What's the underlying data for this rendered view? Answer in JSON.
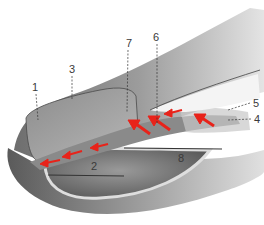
{
  "diagram": {
    "labels": [
      {
        "id": "1",
        "text": "1",
        "x": 35,
        "y": 87
      },
      {
        "id": "2",
        "text": "2",
        "x": 94,
        "y": 166
      },
      {
        "id": "3",
        "text": "3",
        "x": 72,
        "y": 69
      },
      {
        "id": "4",
        "text": "4",
        "x": 257,
        "y": 119
      },
      {
        "id": "5",
        "text": "5",
        "x": 256,
        "y": 103
      },
      {
        "id": "6",
        "text": "6",
        "x": 156,
        "y": 37
      },
      {
        "id": "7",
        "text": "7",
        "x": 129,
        "y": 43
      },
      {
        "id": "8",
        "text": "8",
        "x": 181,
        "y": 158
      }
    ],
    "colors": {
      "arrow": "#e8231a",
      "tissue_dark": "#6a6a6a",
      "tissue_mid": "#9a9a9a",
      "tissue_light": "#cfcfcf",
      "band": "#8a8a8a",
      "label_text": "#3a3a3a",
      "leader_line": "#333333"
    }
  }
}
